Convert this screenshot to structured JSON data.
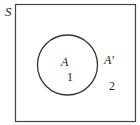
{
  "diagram": {
    "type": "venn",
    "universe_label": "S",
    "set_label": "A",
    "complement_label": "A′",
    "region_inside": "1",
    "region_outside": "2",
    "colors": {
      "stroke": "#333333",
      "text": "#222222",
      "background": "#ffffff"
    }
  }
}
